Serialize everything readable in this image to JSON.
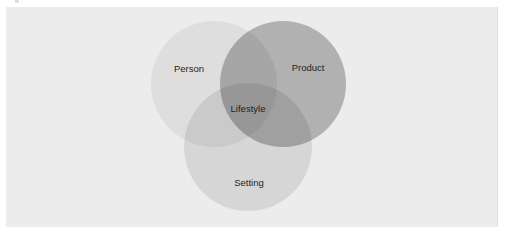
{
  "diagram": {
    "type": "venn",
    "sets": [
      {
        "id": "person",
        "label": "Person",
        "cx": 214,
        "cy": 84,
        "r": 63,
        "fill": "#000000",
        "opacity": 0.06
      },
      {
        "id": "product",
        "label": "Product",
        "cx": 283,
        "cy": 84,
        "r": 63,
        "fill": "#000000",
        "opacity": 0.25
      },
      {
        "id": "setting",
        "label": "Setting",
        "cx": 248,
        "cy": 147,
        "r": 64,
        "fill": "#000000",
        "opacity": 0.09
      }
    ],
    "intersection_label": "Lifestyle",
    "labels": {
      "person": "Person",
      "product": "Product",
      "setting": "Setting",
      "center": "Lifestyle"
    },
    "colors": {
      "page_background": "#ffffff",
      "panel_background": "#ececec",
      "text": "#1e1e1e"
    }
  }
}
